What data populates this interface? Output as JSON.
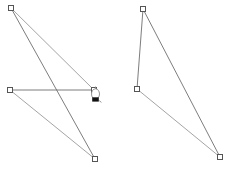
{
  "canvas": {
    "name": "polygon-editor-canvas",
    "width": 230,
    "height": 169,
    "background_color": "#ffffff",
    "edge_color": "#6e6e6e",
    "edge_color_light": "#9a9a9a",
    "vertex_fill": "#ffffff",
    "vertex_stroke": "#555555",
    "vertex_size": 5,
    "stroke_width": 0.9
  },
  "shapes": [
    {
      "id": "shape-left",
      "name": "left-polygon",
      "label": "Left polygon",
      "closed": true,
      "vertices": [
        {
          "name": "vertex-left-top",
          "label": "Top-left vertex",
          "x": 11,
          "y": 8
        },
        {
          "name": "vertex-left-right-mid",
          "label": "Right middle vertex",
          "x": 94,
          "y": 90
        },
        {
          "name": "vertex-left-left-mid",
          "label": "Left middle vertex",
          "x": 10,
          "y": 90
        },
        {
          "name": "vertex-left-bottom",
          "label": "Bottom vertex",
          "x": 95,
          "y": 159
        }
      ],
      "edges": [
        {
          "name": "edge-left-a",
          "label": "Top-left to right-middle",
          "from": 0,
          "to": 1,
          "color": "#9a9a9a"
        },
        {
          "name": "edge-left-b",
          "label": "Right-middle to left-middle",
          "from": 1,
          "to": 2,
          "color": "#6e6e6e"
        },
        {
          "name": "edge-left-c",
          "label": "Left-middle to bottom",
          "from": 2,
          "to": 3,
          "color": "#9a9a9a"
        },
        {
          "name": "edge-left-d",
          "label": "Bottom to top-left",
          "from": 3,
          "to": 0,
          "color": "#6e6e6e"
        }
      ]
    },
    {
      "id": "shape-right",
      "name": "right-polygon",
      "label": "Right triangle polygon",
      "closed": true,
      "vertices": [
        {
          "name": "vertex-right-top",
          "label": "Top vertex",
          "x": 143,
          "y": 9
        },
        {
          "name": "vertex-right-bottom-right",
          "label": "Bottom-right vertex",
          "x": 220,
          "y": 157
        },
        {
          "name": "vertex-right-mid-left",
          "label": "Middle-left vertex",
          "x": 137,
          "y": 89
        }
      ],
      "edges": [
        {
          "name": "edge-right-a",
          "label": "Top to bottom-right",
          "from": 0,
          "to": 1,
          "color": "#6e6e6e"
        },
        {
          "name": "edge-right-b",
          "label": "Bottom-right to middle-left",
          "from": 1,
          "to": 2,
          "color": "#9a9a9a"
        },
        {
          "name": "edge-right-c",
          "label": "Middle-left to top",
          "from": 2,
          "to": 0,
          "color": "#6e6e6e"
        }
      ]
    }
  ],
  "cursor": {
    "name": "pen-tool-cursor",
    "label": "Pen tool cursor",
    "x": 95,
    "y": 95,
    "tip_color": "#111111",
    "outline_color": "#8a8a8a"
  }
}
